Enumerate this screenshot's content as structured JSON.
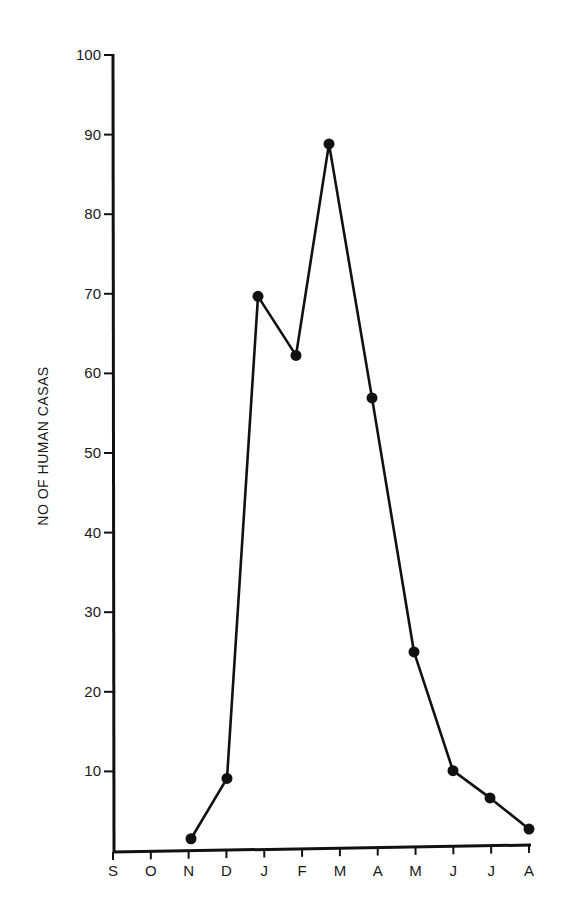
{
  "chart_data": {
    "type": "line",
    "title": "",
    "xlabel": "",
    "ylabel": "NO OF HUMAN CASAS",
    "categories": [
      "S",
      "O",
      "N",
      "D",
      "J",
      "F",
      "M",
      "A",
      "M",
      "J",
      "J",
      "A"
    ],
    "ylim": [
      0,
      100
    ],
    "yticks": [
      10,
      20,
      30,
      40,
      50,
      60,
      70,
      80,
      90,
      100
    ],
    "grid": false,
    "legend": null,
    "series": [
      {
        "name": "Human cases",
        "x": [
          "N",
          "D",
          "J",
          "F",
          "M",
          "A",
          "M",
          "J",
          "J",
          "A"
        ],
        "values": [
          1.5,
          9,
          69.5,
          62,
          88.5,
          56.5,
          24.5,
          9.5,
          6,
          2
        ]
      }
    ],
    "point_x_px": [
      191,
      227,
      258,
      296,
      329,
      372,
      414,
      453,
      490,
      529
    ]
  },
  "colors": {
    "ink": "#111111",
    "background": "#ffffff"
  }
}
